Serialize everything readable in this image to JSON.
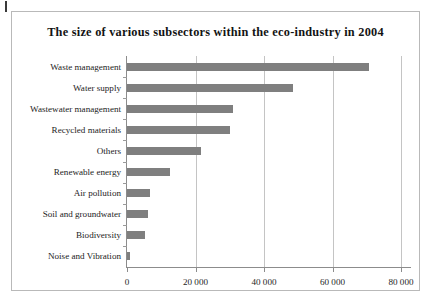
{
  "page": {
    "corner_mark": "page-edge-mark"
  },
  "chart_data": {
    "type": "bar",
    "orientation": "horizontal",
    "title": "The size of various subsectors within the eco-industry in 2004",
    "xlabel": "",
    "ylabel": "",
    "categories": [
      "Waste management",
      "Water supply",
      "Wastewater management",
      "Recycled materials",
      "Others",
      "Renewable energy",
      "Air pollution",
      "Soil and groundwater",
      "Biodiversity",
      "Noise and Vibration"
    ],
    "values": [
      70700,
      48500,
      31000,
      30000,
      21500,
      12500,
      6800,
      6200,
      5200,
      1000
    ],
    "xlim": [
      0,
      80000
    ],
    "xticks": [
      0,
      20000,
      40000,
      60000,
      80000
    ],
    "xtick_labels": [
      "0",
      "20 000",
      "40 000",
      "60 000",
      "80 000"
    ],
    "grid": "vertical",
    "legend": "none",
    "bar_color": "#7f7f7f",
    "axis_color": "#8c8c8c",
    "gridline_color": "#c4c4c4",
    "border_color": "#b9b9b9",
    "background_color": "#ffffff"
  }
}
